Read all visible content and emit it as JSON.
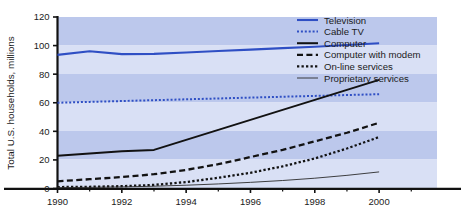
{
  "chart_data": {
    "type": "line",
    "title": "",
    "subtitle": "",
    "xlabel": "",
    "ylabel": "Total U.S. households, millions",
    "xlim": [
      1990,
      2001.8
    ],
    "ylim": [
      0,
      120
    ],
    "grid": false,
    "banded_background": true,
    "band_color_light": "#d9e0f5",
    "band_color_dark": "#bcc8ec",
    "legend_position": "top-right",
    "x_ticks": [
      1990,
      1992,
      1994,
      1996,
      1998,
      2000
    ],
    "x_tick_labels": [
      "1990",
      "1992",
      "1994",
      "1996",
      "1998",
      "2000"
    ],
    "x_minor_ticks": [
      1991,
      1993,
      1995,
      1997,
      1999,
      2001
    ],
    "y_ticks": [
      0,
      20,
      40,
      60,
      80,
      100,
      120
    ],
    "y_tick_labels": [
      "0",
      "20",
      "40",
      "60",
      "80",
      "100",
      "120"
    ],
    "x": [
      1990,
      1991,
      1992,
      1993,
      1994,
      1995,
      1996,
      1997,
      1998,
      1999,
      2000
    ],
    "series": [
      {
        "name": "Television",
        "color": "#2f4fc4",
        "style": "solid",
        "width": 2.1,
        "values": [
          93.5,
          96.0,
          94.0,
          94.2,
          95.2,
          96.2,
          97.2,
          98.2,
          99.2,
          100.4,
          101.6
        ]
      },
      {
        "name": "Cable TV",
        "color": "#2f4fc4",
        "style": "dotted",
        "width": 2.0,
        "values": [
          60.0,
          60.6,
          61.2,
          61.8,
          62.4,
          63.0,
          63.6,
          64.2,
          64.8,
          65.4,
          66.0
        ]
      },
      {
        "name": "Computer",
        "color": "#121212",
        "style": "solid",
        "width": 2.0,
        "values": [
          23.0,
          24.5,
          26.0,
          27.0,
          34.0,
          41.0,
          48.0,
          55.0,
          62.0,
          69.0,
          76.0
        ]
      },
      {
        "name": "Computer with modem",
        "color": "#121212",
        "style": "dashed",
        "width": 2.3,
        "values": [
          5.0,
          6.5,
          8.0,
          10.0,
          13.0,
          17.0,
          22.0,
          27.0,
          33.0,
          39.0,
          46.0
        ]
      },
      {
        "name": "On-line services",
        "color": "#121212",
        "style": "dotted",
        "width": 2.3,
        "values": [
          1.0,
          1.2,
          1.6,
          2.5,
          4.5,
          7.5,
          11.0,
          15.5,
          21.0,
          28.0,
          36.0
        ]
      },
      {
        "name": "Proprietary services",
        "color": "#2b2b2b",
        "style": "solid",
        "width": 0.9,
        "values": [
          0.6,
          0.8,
          1.1,
          1.6,
          2.3,
          3.2,
          4.3,
          5.6,
          7.2,
          9.2,
          11.6
        ]
      }
    ]
  },
  "legend": {
    "items": [
      {
        "label": "Television",
        "swatch": "television-swatch"
      },
      {
        "label": "Cable TV",
        "swatch": "cable-tv-swatch"
      },
      {
        "label": "Computer",
        "swatch": "computer-swatch"
      },
      {
        "label": "Computer with modem",
        "swatch": "computer-with-modem-swatch"
      },
      {
        "label": "On-line services",
        "swatch": "on-line-services-swatch"
      },
      {
        "label": "Proprietary services",
        "swatch": "proprietary-services-swatch"
      }
    ]
  }
}
